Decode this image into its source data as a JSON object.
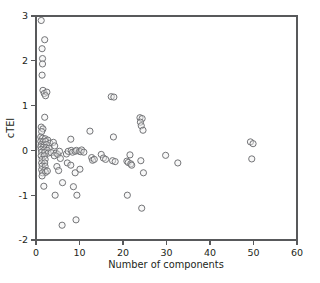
{
  "chart_data": {
    "type": "scatter",
    "title": "",
    "xlabel": "Number of components",
    "ylabel": "cTEI",
    "xlim": [
      0,
      60
    ],
    "ylim": [
      -2,
      3
    ],
    "xticks": [
      0,
      10,
      20,
      30,
      40,
      50,
      60
    ],
    "yticks": [
      -2,
      -1,
      0,
      1,
      2,
      3
    ],
    "xtick_labels": [
      "0",
      "10",
      "20",
      "30",
      "40",
      "50",
      "60"
    ],
    "ytick_labels": [
      "-2",
      "-1",
      "0",
      "1",
      "2",
      "3"
    ],
    "grid": false,
    "legend": null,
    "marker": {
      "shape": "open-circle",
      "radius_px": 3.1,
      "stroke_color": "#6d6e71",
      "fill_color": "#f0f0f0"
    },
    "axis_color": "#58595b",
    "n_points": 118,
    "points": [
      [
        1.2,
        2.9
      ],
      [
        2.0,
        2.47
      ],
      [
        1.4,
        2.27
      ],
      [
        1.5,
        2.05
      ],
      [
        1.5,
        1.93
      ],
      [
        1.4,
        1.68
      ],
      [
        1.6,
        1.34
      ],
      [
        1.9,
        1.27
      ],
      [
        2.5,
        1.3
      ],
      [
        2.2,
        1.22
      ],
      [
        2.0,
        0.74
      ],
      [
        1.2,
        0.52
      ],
      [
        1.6,
        0.48
      ],
      [
        1.3,
        0.42
      ],
      [
        1.1,
        0.3
      ],
      [
        1.5,
        0.27
      ],
      [
        2.1,
        0.26
      ],
      [
        2.7,
        0.23
      ],
      [
        1.1,
        0.2
      ],
      [
        1.6,
        0.19
      ],
      [
        2.2,
        0.2
      ],
      [
        3.2,
        0.16
      ],
      [
        1.2,
        0.13
      ],
      [
        1.8,
        0.12
      ],
      [
        2.4,
        0.13
      ],
      [
        1.1,
        0.08
      ],
      [
        1.7,
        0.07
      ],
      [
        2.3,
        0.06
      ],
      [
        3.0,
        0.05
      ],
      [
        1.2,
        0.02
      ],
      [
        1.9,
        0.01
      ],
      [
        2.6,
        0.0
      ],
      [
        1.3,
        -0.04
      ],
      [
        2.0,
        -0.05
      ],
      [
        2.8,
        -0.06
      ],
      [
        3.5,
        -0.05
      ],
      [
        1.2,
        -0.12
      ],
      [
        1.9,
        -0.12
      ],
      [
        1.4,
        -0.2
      ],
      [
        2.1,
        -0.2
      ],
      [
        1.3,
        -0.28
      ],
      [
        2.0,
        -0.28
      ],
      [
        1.4,
        -0.35
      ],
      [
        2.1,
        -0.36
      ],
      [
        1.3,
        -0.43
      ],
      [
        2.0,
        -0.44
      ],
      [
        1.5,
        -0.5
      ],
      [
        2.2,
        -0.49
      ],
      [
        2.6,
        -0.46
      ],
      [
        1.4,
        -0.57
      ],
      [
        1.8,
        -0.8
      ],
      [
        4.0,
        0.18
      ],
      [
        4.3,
        0.1
      ],
      [
        4.6,
        -0.06
      ],
      [
        4.2,
        -0.12
      ],
      [
        5.0,
        -0.09
      ],
      [
        5.4,
        -0.02
      ],
      [
        5.6,
        -0.18
      ],
      [
        4.8,
        -0.36
      ],
      [
        5.2,
        -0.45
      ],
      [
        4.4,
        -1.0
      ],
      [
        6.1,
        -0.72
      ],
      [
        6.0,
        -1.67
      ],
      [
        7.0,
        -0.08
      ],
      [
        7.4,
        -0.02
      ],
      [
        7.2,
        -0.28
      ],
      [
        8.0,
        0.25
      ],
      [
        8.1,
        0.0
      ],
      [
        8.4,
        -0.04
      ],
      [
        8.0,
        -0.33
      ],
      [
        8.6,
        -0.81
      ],
      [
        9.0,
        -0.02
      ],
      [
        9.3,
        0.0
      ],
      [
        9.0,
        -0.5
      ],
      [
        9.4,
        -1.0
      ],
      [
        9.2,
        -1.55
      ],
      [
        10.0,
        -0.02
      ],
      [
        10.3,
        -0.03
      ],
      [
        10.5,
        0.01
      ],
      [
        10.1,
        -0.42
      ],
      [
        11.0,
        -0.04
      ],
      [
        12.4,
        0.43
      ],
      [
        12.8,
        -0.16
      ],
      [
        13.0,
        -0.22
      ],
      [
        13.4,
        -0.2
      ],
      [
        15.0,
        -0.09
      ],
      [
        15.5,
        -0.17
      ],
      [
        16.0,
        -0.2
      ],
      [
        17.3,
        1.2
      ],
      [
        17.9,
        1.19
      ],
      [
        17.8,
        0.3
      ],
      [
        17.6,
        -0.23
      ],
      [
        18.2,
        -0.25
      ],
      [
        20.9,
        -0.24
      ],
      [
        21.2,
        -0.27
      ],
      [
        21.0,
        -1.0
      ],
      [
        21.6,
        -0.1
      ],
      [
        21.8,
        -0.3
      ],
      [
        22.0,
        -0.33
      ],
      [
        23.9,
        0.73
      ],
      [
        24.4,
        0.71
      ],
      [
        24.0,
        0.63
      ],
      [
        24.2,
        0.55
      ],
      [
        24.6,
        0.45
      ],
      [
        24.1,
        -0.23
      ],
      [
        24.7,
        -0.5
      ],
      [
        24.3,
        -1.29
      ],
      [
        29.8,
        -0.11
      ],
      [
        32.6,
        -0.28
      ],
      [
        49.3,
        0.19
      ],
      [
        49.9,
        0.15
      ],
      [
        49.6,
        -0.19
      ]
    ]
  }
}
